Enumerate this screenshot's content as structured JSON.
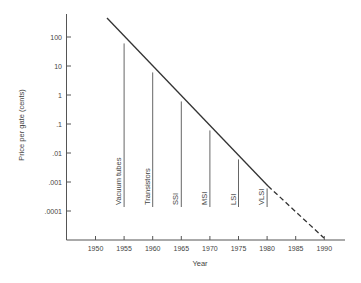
{
  "chart_data": {
    "type": "line",
    "title": "",
    "xlabel": "Year",
    "ylabel": "Price per gate (cents)",
    "yscale": "log",
    "grid": false,
    "legend": null,
    "x_ticks": [
      "1950",
      "1955",
      "1960",
      "1965",
      "1970",
      "1975",
      "1980",
      "1985",
      "1990"
    ],
    "y_ticks": [
      "100",
      "10",
      "1",
      ".1",
      ".01",
      ".001",
      ".0001"
    ],
    "xlim": [
      1946,
      1993
    ],
    "ylim": [
      3e-06,
      1000
    ],
    "series": [
      {
        "name": "Price per gate trend (solid)",
        "style": "solid",
        "x": [
          1952,
          1980
        ],
        "y": [
          300,
          0.0012
        ]
      },
      {
        "name": "Price per gate trend (projected, dashed)",
        "style": "dashed",
        "x": [
          1980,
          1990
        ],
        "y": [
          0.0012,
          1.2e-05
        ]
      }
    ],
    "annotations": [
      {
        "label": "Vacuum tubes",
        "x": 1955,
        "y_top": 60
      },
      {
        "label": "Transistors",
        "x": 1960,
        "y_top": 6
      },
      {
        "label": "SSI",
        "x": 1965,
        "y_top": 0.6
      },
      {
        "label": "MSI",
        "x": 1970,
        "y_top": 0.06
      },
      {
        "label": "LSI",
        "x": 1975,
        "y_top": 0.006
      },
      {
        "label": "VLSI",
        "x": 1980,
        "y_top": 0.0006
      }
    ]
  },
  "axes": {
    "x_title": "Year",
    "y_title": "Price per gate (cents)"
  }
}
